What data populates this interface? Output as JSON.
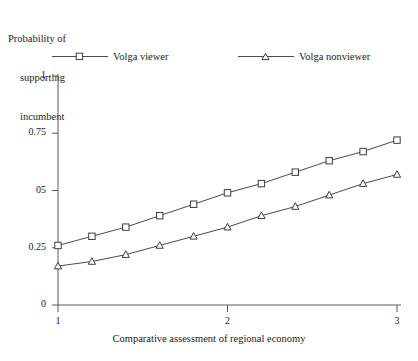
{
  "figure": {
    "y_axis_title_lines": [
      "Probability of",
      "supporting",
      "incumbent"
    ],
    "x_axis_title": "Comparative assessment of regional economy"
  },
  "legend": {
    "entries": [
      {
        "label": "Volga viewer",
        "marker": "square-marker"
      },
      {
        "label": "Volga nonviewer",
        "marker": "triangle-marker"
      }
    ]
  },
  "axes": {
    "y_tick_labels": [
      "1",
      "0.75",
      "05",
      "0.25",
      "0"
    ],
    "x_tick_labels": [
      "1",
      "2",
      "3"
    ]
  },
  "chart_data": {
    "type": "line",
    "title": "",
    "xlabel": "Comparative assessment of regional economy",
    "ylabel": "Probability of supporting incumbent",
    "xlim": [
      1,
      3
    ],
    "ylim": [
      0,
      1
    ],
    "grid": false,
    "legend_position": "top",
    "x": [
      1.0,
      1.2,
      1.4,
      1.6,
      1.8,
      2.0,
      2.2,
      2.4,
      2.6,
      2.8,
      3.0
    ],
    "y_ticks": [
      0,
      0.25,
      0.5,
      0.75,
      1
    ],
    "y_tick_text": [
      "0",
      "0.25",
      "05",
      "0.75",
      "1"
    ],
    "x_ticks": [
      1,
      2,
      3
    ],
    "series": [
      {
        "name": "Volga viewer",
        "marker": "square",
        "values": [
          0.26,
          0.3,
          0.34,
          0.39,
          0.44,
          0.49,
          0.53,
          0.58,
          0.63,
          0.67,
          0.72
        ]
      },
      {
        "name": "Volga nonviewer",
        "marker": "triangle",
        "values": [
          0.17,
          0.19,
          0.22,
          0.26,
          0.3,
          0.34,
          0.39,
          0.43,
          0.48,
          0.53,
          0.57
        ]
      }
    ]
  }
}
